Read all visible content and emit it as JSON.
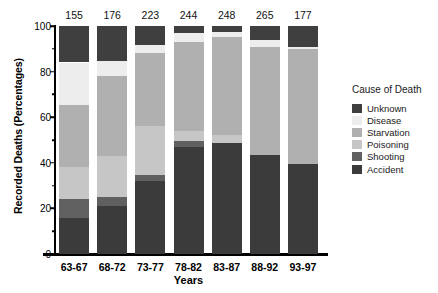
{
  "chart_data": {
    "type": "bar",
    "subtype": "stacked-bar-100-percent",
    "title": "",
    "xlabel": "Years",
    "ylabel": "Recorded Deaths (Percentages)",
    "ylim": [
      0,
      100
    ],
    "yticks": [
      0,
      20,
      40,
      60,
      80,
      100
    ],
    "ytick_labels": [
      "0",
      "20",
      "40",
      "60",
      "80",
      "100"
    ],
    "yminor_ticks": [
      10,
      30,
      50,
      70,
      90
    ],
    "grid": false,
    "legend_position": "right",
    "legend_title": "Cause of Death",
    "categories": [
      "63-67",
      "68-72",
      "73-77",
      "78-82",
      "83-87",
      "88-92",
      "93-97"
    ],
    "bar_totals": [
      155,
      176,
      223,
      244,
      248,
      265,
      177
    ],
    "bar_total_note": "Sample size (N) printed above each bar",
    "stack_order_bottom_to_top": [
      "Accident",
      "Shooting",
      "Poisoning",
      "Starvation",
      "Disease",
      "Unknown"
    ],
    "series": [
      {
        "name": "Accident",
        "color": "#3b3b3b",
        "values": [
          16.0,
          21.0,
          32.0,
          47.0,
          48.5,
          43.5,
          39.5
        ]
      },
      {
        "name": "Shooting",
        "color": "#606060",
        "values": [
          8.0,
          4.0,
          2.5,
          2.5,
          0.0,
          0.0,
          0.0
        ]
      },
      {
        "name": "Poisoning",
        "color": "#c6c6c6",
        "values": [
          14.0,
          18.0,
          21.5,
          4.5,
          3.5,
          0.0,
          0.0
        ]
      },
      {
        "name": "Starvation",
        "color": "#b0b0b0",
        "values": [
          27.5,
          35.0,
          32.0,
          39.0,
          43.0,
          47.5,
          50.5
        ]
      },
      {
        "name": "Disease",
        "color": "#ededed",
        "values": [
          18.5,
          6.5,
          3.5,
          4.0,
          2.5,
          3.0,
          1.0
        ]
      },
      {
        "name": "Unknown",
        "color": "#3f3f3f",
        "values": [
          16.0,
          15.5,
          8.5,
          3.0,
          2.5,
          6.0,
          9.0
        ]
      }
    ]
  },
  "legend": {
    "title": "Cause of Death",
    "items": [
      {
        "label": "Unknown",
        "color": "#3f3f3f"
      },
      {
        "label": "Disease",
        "color": "#ededed"
      },
      {
        "label": "Starvation",
        "color": "#b0b0b0"
      },
      {
        "label": "Poisoning",
        "color": "#c6c6c6"
      },
      {
        "label": "Shooting",
        "color": "#606060"
      },
      {
        "label": "Accident",
        "color": "#3b3b3b"
      }
    ]
  },
  "axes": {
    "y_title": "Recorded Deaths (Percentages)",
    "x_title": "Years"
  },
  "colors": {
    "axis": "#000000",
    "background": "#ffffff",
    "text": "#111111"
  }
}
